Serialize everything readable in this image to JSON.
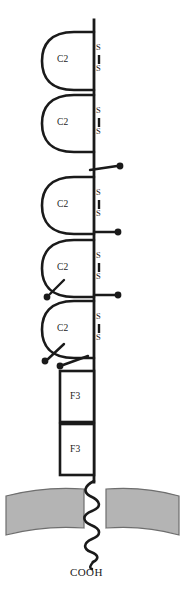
{
  "figure": {
    "type": "protein-domain-topology-diagram",
    "background_color": "#ffffff",
    "stroke_color": "#1a1a1a",
    "membrane_color": "#b0b0b0",
    "membrane_edge_color": "#6e6e6e"
  },
  "labels": {
    "c_terminus": "COOH",
    "ig_domain": "C2",
    "fn3_domain": "F3",
    "sulfur_upper": "S",
    "sulfur_lower": "S"
  },
  "backbone": {
    "x": 94,
    "top_y": 20,
    "bottom_y": 481,
    "stroke_width": 2.6
  },
  "ig_domains": [
    {
      "index": 1,
      "label": "C2",
      "top_y": 32,
      "bottom_y": 90,
      "loop_left_x": 47,
      "s_upper_y": 47,
      "s_lower_y": 70
    },
    {
      "index": 2,
      "label": "C2",
      "top_y": 95,
      "bottom_y": 152,
      "loop_left_x": 47,
      "s_upper_y": 110,
      "s_lower_y": 133
    },
    {
      "index": 3,
      "label": "C2",
      "top_y": 177,
      "bottom_y": 234,
      "loop_left_x": 47,
      "s_upper_y": 192,
      "s_lower_y": 215
    },
    {
      "index": 4,
      "label": "C2",
      "top_y": 240,
      "bottom_y": 297,
      "loop_left_x": 47,
      "s_upper_y": 255,
      "s_lower_y": 278
    },
    {
      "index": 5,
      "label": "C2",
      "top_y": 301,
      "bottom_y": 358,
      "loop_left_x": 47,
      "s_upper_y": 316,
      "s_lower_y": 339
    }
  ],
  "fn3_domains": [
    {
      "index": 1,
      "label": "F3",
      "x": 60,
      "y": 371,
      "width": 34,
      "height": 51
    },
    {
      "index": 2,
      "label": "F3",
      "x": 60,
      "y": 424,
      "width": 34,
      "height": 51
    }
  ],
  "glycosylation_sites": [
    {
      "index": 1,
      "side": "right",
      "origin_x": 94,
      "origin_y": 169,
      "end_x": 121,
      "end_y": 166
    },
    {
      "index": 2,
      "side": "right",
      "origin_x": 94,
      "origin_y": 232,
      "end_x": 119,
      "end_y": 232
    },
    {
      "index": 3,
      "side": "right",
      "origin_x": 94,
      "origin_y": 295,
      "end_x": 119,
      "end_y": 295
    },
    {
      "index": 4,
      "side": "left",
      "origin_x": 66,
      "origin_y": 281,
      "end_x": 47,
      "end_y": 296
    },
    {
      "index": 5,
      "side": "left",
      "origin_x": 66,
      "origin_y": 345,
      "end_x": 45,
      "end_y": 360
    },
    {
      "index": 6,
      "side": "left",
      "origin_x": 84,
      "origin_y": 357,
      "end_x": 60,
      "end_y": 366
    }
  ],
  "membrane": {
    "top_y": 489,
    "bottom_y": 528,
    "left_x": 6,
    "right_x": 179,
    "gap_left_x": 82,
    "gap_right_x": 106,
    "curve_sag": 10
  },
  "transmembrane_coil": {
    "start_y": 481,
    "end_y": 556,
    "center_x": 94,
    "amplitude": 11,
    "turns": 7
  }
}
